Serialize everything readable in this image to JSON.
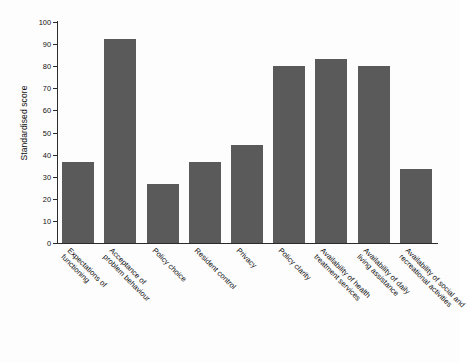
{
  "chart_data": {
    "type": "bar",
    "title": "",
    "xlabel": "",
    "ylabel": "Standardised score",
    "ylim": [
      0,
      100
    ],
    "yticks": [
      0,
      10,
      20,
      30,
      40,
      50,
      60,
      70,
      80,
      90,
      100
    ],
    "grid": false,
    "legend": "none",
    "bar_color": "#5a5a5a",
    "categories": [
      "Expectations of functioning",
      "Acceptance of problem behaviour",
      "Policy choice",
      "Resident control",
      "Privacy",
      "Policy clarity",
      "Availability of health treatment services",
      "Availability of daily living assistance",
      "Availability of social and recreational activities"
    ],
    "category_lines": [
      [
        "Expectations of",
        "functioning"
      ],
      [
        "Acceptance of",
        "problem behaviour"
      ],
      [
        "Policy choice",
        ""
      ],
      [
        "Resident control",
        ""
      ],
      [
        "Privacy",
        ""
      ],
      [
        "Policy clarity",
        ""
      ],
      [
        "Availability of health",
        "treatment services"
      ],
      [
        "Availability of daily",
        "living assistance"
      ],
      [
        "Availability of social and",
        "recreational activities"
      ]
    ],
    "values": [
      36.5,
      92.3,
      26.7,
      36.5,
      44.2,
      80.0,
      83.3,
      80.0,
      33.7
    ]
  }
}
